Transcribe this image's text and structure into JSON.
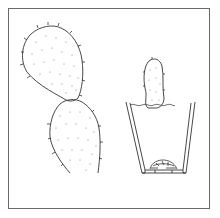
{
  "illustration": {
    "subject": "Prickly pear cactus pads and a potted cutting",
    "elements": [
      {
        "name": "cactus-pad-cluster",
        "description": "Two joined opuntia pads with spines"
      },
      {
        "name": "potted-cutting",
        "description": "Single pad planted in a tapered pot with drainage shards"
      }
    ],
    "colors": {
      "line": "#333333",
      "frame": "#6a6a6a",
      "background": "#ffffff",
      "dots": "#777777"
    }
  }
}
